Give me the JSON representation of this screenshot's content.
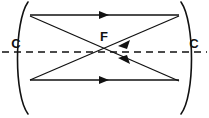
{
  "figure": {
    "kind": "optics-ray-diagram",
    "background_color": "#ffffff",
    "ink_color": "#111111",
    "width": 209,
    "height": 118
  },
  "labels": {
    "left_center_of_curvature": "C",
    "right_center_of_curvature": "C",
    "focal_point": "F"
  },
  "label_positions": {
    "left_c": {
      "x": 16,
      "y": 45
    },
    "right_c": {
      "x": 194,
      "y": 45
    },
    "focal_f": {
      "x": 104,
      "y": 38
    }
  },
  "optical_axis": {
    "name": "principal-axis",
    "style": "dashed",
    "y": 52,
    "x_start": 2,
    "x_end": 207
  },
  "mirrors": [
    {
      "name": "left-concave-mirror",
      "side": "left",
      "top": {
        "x": 28,
        "y": 2
      },
      "vertex": {
        "x": 20,
        "y": 52
      },
      "bottom": {
        "x": 28,
        "y": 114
      }
    },
    {
      "name": "right-concave-mirror",
      "side": "right",
      "top": {
        "x": 181,
        "y": 2
      },
      "vertex": {
        "x": 189,
        "y": 52
      },
      "bottom": {
        "x": 181,
        "y": 114
      }
    }
  ],
  "rays": [
    {
      "name": "top-horizontal-ray",
      "from": {
        "x": 30,
        "y": 15
      },
      "to": {
        "x": 179,
        "y": 15
      },
      "direction": "right",
      "arrow_at": {
        "x": 104,
        "y": 15
      }
    },
    {
      "name": "bottom-horizontal-ray",
      "from": {
        "x": 30,
        "y": 80
      },
      "to": {
        "x": 179,
        "y": 80
      },
      "direction": "right",
      "arrow_at": {
        "x": 104,
        "y": 80
      }
    },
    {
      "name": "upper-left-to-lower-right-diagonal",
      "from": {
        "x": 30,
        "y": 16
      },
      "to": {
        "x": 179,
        "y": 81
      },
      "direction": "left",
      "arrow_at": {
        "x": 124,
        "y": 61
      }
    },
    {
      "name": "lower-left-to-upper-right-diagonal",
      "from": {
        "x": 30,
        "y": 80
      },
      "to": {
        "x": 179,
        "y": 16
      },
      "direction": "left",
      "arrow_at": {
        "x": 124,
        "y": 42
      }
    }
  ],
  "crossing_point": {
    "x": 104,
    "y": 52,
    "label": "F"
  }
}
